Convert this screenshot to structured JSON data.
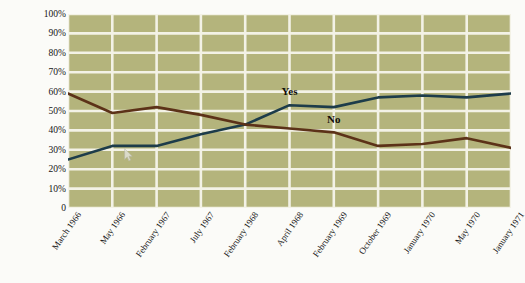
{
  "figure": {
    "title_partial": "",
    "ylabel": "Response (in percent)",
    "series_labels": {
      "yes": "Yes",
      "no": "No"
    },
    "colors": {
      "plot_background": "#b4b47c",
      "gridline": "#f3f2e6",
      "yes_line": "#1d3c4a",
      "no_line": "#5c3218",
      "page_background": "#fbfbf8",
      "text": "#141414"
    },
    "cursor": {
      "name": "mouse-pointer",
      "x": 124,
      "y": 148
    }
  },
  "chart_data": {
    "type": "line",
    "title": "",
    "xlabel": "",
    "ylabel": "Response (in percent)",
    "ylim": [
      0,
      100
    ],
    "yticks": [
      0,
      10,
      20,
      30,
      40,
      50,
      60,
      70,
      80,
      90,
      100
    ],
    "ytick_labels": [
      "0",
      "10%",
      "20%",
      "30%",
      "40%",
      "50%",
      "60%",
      "70%",
      "80%",
      "90%",
      "100%"
    ],
    "grid": true,
    "legend_position": "inline-annotations",
    "categories": [
      "March 1966",
      "May 1966",
      "February 1967",
      "July 1967",
      "February 1968",
      "April 1968",
      "February 1969",
      "October 1969",
      "January 1970",
      "May 1970",
      "January 1971"
    ],
    "series": [
      {
        "name": "Yes",
        "color": "#1d3c4a",
        "values": [
          25,
          32,
          32,
          38,
          43,
          53,
          52,
          57,
          58,
          57,
          59
        ]
      },
      {
        "name": "No",
        "color": "#5c3218",
        "values": [
          59,
          49,
          52,
          48,
          43,
          41,
          39,
          32,
          33,
          36,
          31
        ]
      }
    ],
    "annotations": [
      {
        "text": "Yes",
        "category": "April 1968",
        "value": 58
      },
      {
        "text": "No",
        "category": "February 1969",
        "value": 44
      }
    ]
  }
}
